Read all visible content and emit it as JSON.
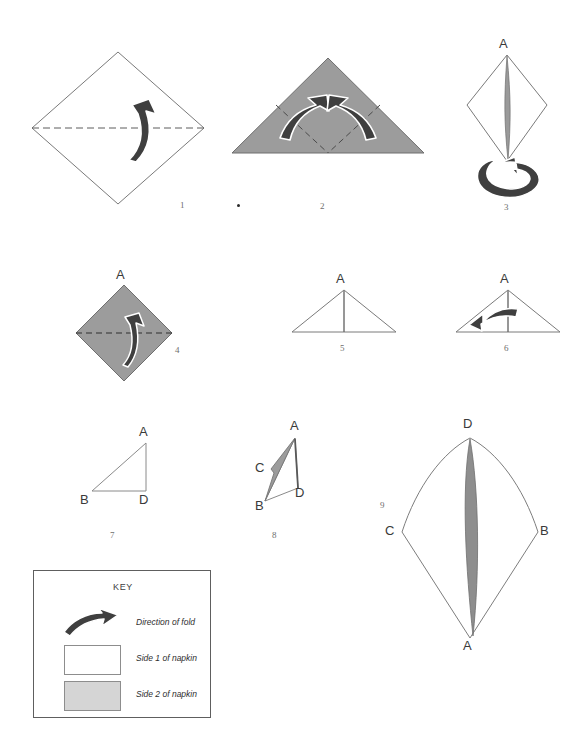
{
  "figure": {
    "type": "instructional-diagram",
    "colors": {
      "napkin_side1": "#ffffff",
      "napkin_side2": "#9c9c9c",
      "key_side2_swatch": "#d5d5d5",
      "outline": "#6f6f6f",
      "arrow_fill": "#3f3f3f",
      "arrow_outline": "#ffffff",
      "label_text": "#3a3a3a",
      "step_number_text": "#6e6e6e"
    }
  },
  "steps": [
    {
      "number": "1",
      "shape": "square-diamond",
      "side_shown": "Side 1 of napkin",
      "fold_line": "horizontal-dashed",
      "arrow": "fold-up",
      "vertex_labels": []
    },
    {
      "number": "2",
      "shape": "triangle",
      "side_shown": "Side 2 of napkin",
      "fold_line": "v-shaped-dashed",
      "arrow": "two-folds-inward-up",
      "vertex_labels": []
    },
    {
      "number": "3",
      "shape": "kite-diamond",
      "side_shown": "Side 1 of napkin",
      "arrow": "turn-over-loop",
      "vertex_labels": [
        "A"
      ]
    },
    {
      "number": "4",
      "shape": "square-diamond",
      "side_shown": "Side 2 of napkin",
      "fold_line": "horizontal-dashed",
      "arrow": "fold-up",
      "vertex_labels": [
        "A"
      ]
    },
    {
      "number": "5",
      "shape": "triangle-with-centre-line",
      "side_shown": "Side 1 of napkin",
      "vertex_labels": [
        "A"
      ]
    },
    {
      "number": "6",
      "shape": "triangle-with-centre-line",
      "side_shown": "Side 1 of napkin",
      "arrow": "fold-left",
      "vertex_labels": [
        "A"
      ]
    },
    {
      "number": "7",
      "shape": "right-triangle",
      "side_shown": "Side 1 of napkin",
      "vertex_labels": [
        "A",
        "B",
        "D"
      ]
    },
    {
      "number": "8",
      "shape": "opened-cone",
      "side_shown": "both sides",
      "vertex_labels": [
        "A",
        "B",
        "C",
        "D"
      ]
    },
    {
      "number": "9",
      "shape": "finished-kite",
      "side_shown": "both sides",
      "vertex_labels": [
        "A",
        "B",
        "C",
        "D"
      ]
    }
  ],
  "labels": {
    "step1_number": "1",
    "step2_number": "2",
    "step3_number": "3",
    "step4_number": "4",
    "step5_number": "5",
    "step6_number": "6",
    "step7_number": "7",
    "step8_number": "8",
    "step9_number": "9",
    "step3_A": "A",
    "step4_A": "A",
    "step5_A": "A",
    "step6_A": "A",
    "step7_A": "A",
    "step7_B": "B",
    "step7_D": "D",
    "step8_A": "A",
    "step8_B": "B",
    "step8_C": "C",
    "step8_D": "D",
    "step9_A": "A",
    "step9_B": "B",
    "step9_C": "C",
    "step9_D": "D"
  },
  "key": {
    "title": "KEY",
    "rows": [
      {
        "icon": "fold-arrow-icon",
        "label": "Direction of fold"
      },
      {
        "icon": "white-swatch",
        "label": "Side 1 of napkin"
      },
      {
        "icon": "gray-swatch",
        "label": "Side 2 of napkin"
      }
    ]
  }
}
